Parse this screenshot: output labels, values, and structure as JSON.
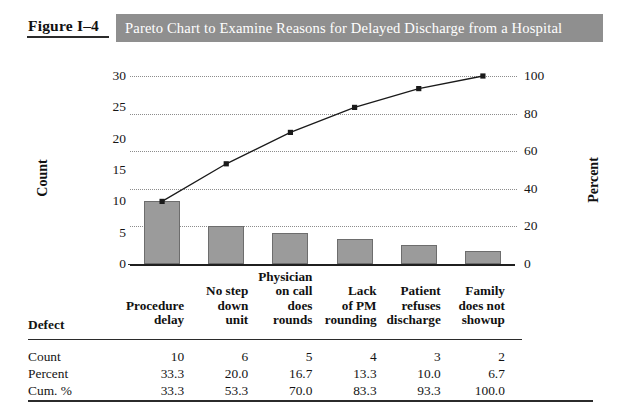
{
  "header": {
    "figure_number": "Figure I–4",
    "title": "Pareto Chart to Examine Reasons for Delayed Discharge from a Hospital",
    "banner_color": "#8f8f8f",
    "title_color": "#ffffff"
  },
  "chart_data": {
    "type": "bar",
    "title": "Pareto Chart to Examine Reasons for Delayed Discharge from a Hospital",
    "categories": [
      "Procedure delay",
      "No step down unit",
      "Physician on call does rounds",
      "Lack of PM rounding",
      "Patient refuses discharge",
      "Family does not showup"
    ],
    "category_lines": [
      [
        "Procedure",
        "delay"
      ],
      [
        "No step",
        "down",
        "unit"
      ],
      [
        "Physician",
        "on call",
        "does",
        "rounds"
      ],
      [
        "Lack",
        "of PM",
        "rounding"
      ],
      [
        "Patient",
        "refuses",
        "discharge"
      ],
      [
        "Family",
        "does not",
        "showup"
      ]
    ],
    "values": [
      10,
      6,
      5,
      4,
      3,
      2
    ],
    "percent": [
      33.3,
      20.0,
      16.7,
      13.3,
      10.0,
      6.7
    ],
    "cumulative_percent": [
      33.3,
      53.3,
      70.0,
      83.3,
      93.3,
      100.0
    ],
    "series": [
      {
        "name": "Count",
        "type": "bar",
        "values": [
          10,
          6,
          5,
          4,
          3,
          2
        ]
      },
      {
        "name": "Cum. %",
        "type": "line",
        "values": [
          33.3,
          53.3,
          70.0,
          83.3,
          93.3,
          100.0
        ]
      }
    ],
    "xlabel": "",
    "ylabel": "Count",
    "y2label": "Percent",
    "ylim": [
      0,
      30
    ],
    "y2lim": [
      0,
      100
    ],
    "yticks": [
      "0",
      "5",
      "10",
      "15",
      "20",
      "25",
      "30"
    ],
    "y2ticks": [
      "0",
      "20",
      "40",
      "60",
      "80",
      "100"
    ],
    "grid": true,
    "grid_axis": "percent",
    "legend": "none",
    "bar_color": "#9b9b9b",
    "bar_edge_color": "#6d6d6d",
    "line_color": "#1a1a1a"
  },
  "table": {
    "row_header_label": "Defect",
    "rows": [
      {
        "label": "Count",
        "values": [
          "10",
          "6",
          "5",
          "4",
          "3",
          "2"
        ]
      },
      {
        "label": "Percent",
        "values": [
          "33.3",
          "20.0",
          "16.7",
          "13.3",
          "10.0",
          "6.7"
        ]
      },
      {
        "label": "Cum. %",
        "values": [
          "33.3",
          "53.3",
          "70.0",
          "83.3",
          "93.3",
          "100.0"
        ]
      }
    ]
  }
}
